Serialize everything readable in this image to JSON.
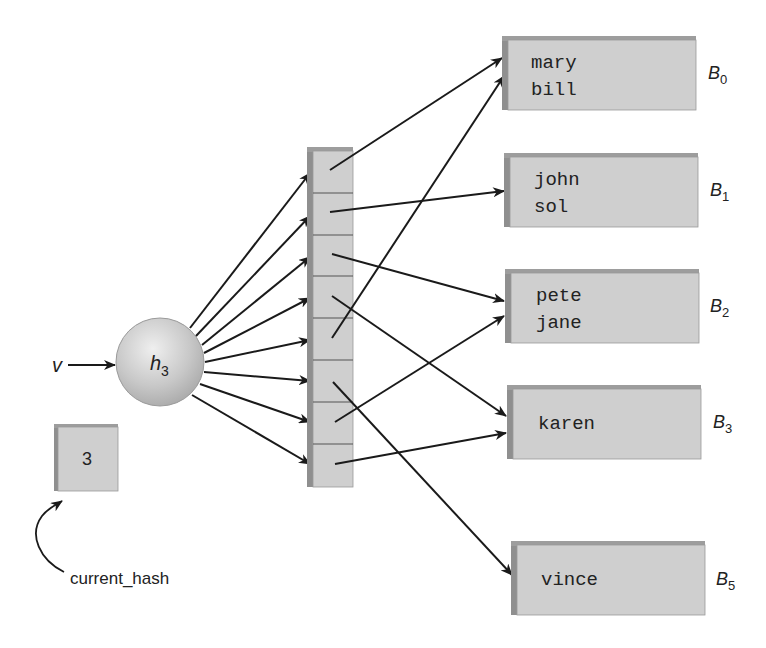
{
  "input_label": "v",
  "hash_function": {
    "name": "h",
    "subscript": "3"
  },
  "current_hash": {
    "value": "3",
    "label": "current_hash"
  },
  "table": {
    "slots": 8,
    "slot_targets": [
      "B0",
      "B1",
      "B2",
      "B3",
      "B0",
      "B5",
      "B2",
      "B3"
    ]
  },
  "buckets": [
    {
      "id": "B0",
      "label": "B",
      "subscript": "0",
      "items": [
        "mary",
        "bill"
      ]
    },
    {
      "id": "B1",
      "label": "B",
      "subscript": "1",
      "items": [
        "john",
        "sol"
      ]
    },
    {
      "id": "B2",
      "label": "B",
      "subscript": "2",
      "items": [
        "pete",
        "jane"
      ]
    },
    {
      "id": "B3",
      "label": "B",
      "subscript": "3",
      "items": [
        "karen"
      ]
    },
    {
      "id": "B5",
      "label": "B",
      "subscript": "5",
      "items": [
        "vince"
      ]
    }
  ],
  "colors": {
    "box_face": "#cfcfcf",
    "box_edge": "#8f8f8f",
    "box_top": "#9d9d9d",
    "line": "#1a1a1a",
    "sphere": "#c9c9c9"
  }
}
